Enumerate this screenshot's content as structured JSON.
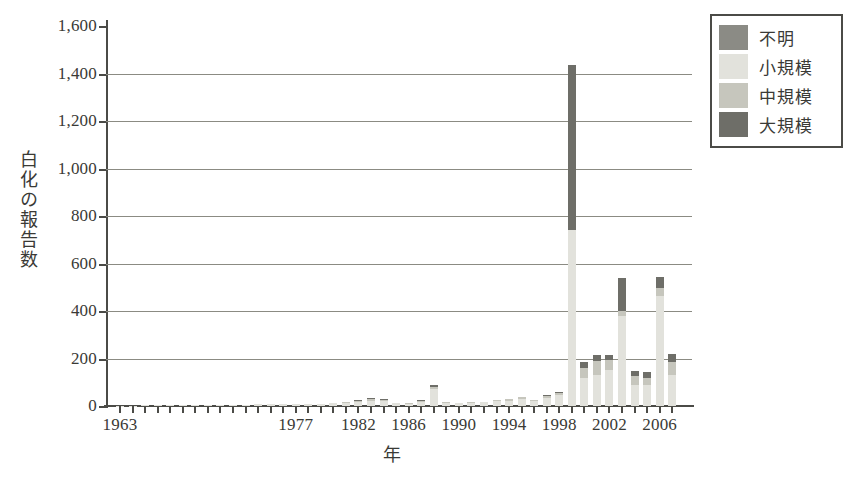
{
  "chart_data": {
    "type": "bar",
    "stacked": true,
    "title": "",
    "xlabel": "年",
    "ylabel": "白化の報告数",
    "ylim": [
      0,
      1600
    ],
    "ytick_labels": [
      "0",
      "200",
      "400",
      "600",
      "800",
      "1,000",
      "1,200",
      "1,400",
      "1,600"
    ],
    "ytick_values": [
      0,
      200,
      400,
      600,
      800,
      1000,
      1200,
      1400,
      1600
    ],
    "xtick_labels": [
      "1963",
      "1977",
      "1982",
      "1986",
      "1990",
      "1994",
      "1998",
      "2002",
      "2006"
    ],
    "xtick_values": [
      1963,
      1977,
      1982,
      1986,
      1990,
      1994,
      1998,
      2002,
      2006
    ],
    "grid": true,
    "legend_position": "outside-top-right",
    "series": [
      {
        "name": "不明",
        "color": "#8b8b85",
        "values": [
          0,
          0,
          0,
          0,
          0,
          0,
          0,
          0,
          0,
          0,
          0,
          0,
          0,
          0,
          0,
          0,
          0,
          0,
          0,
          0,
          0,
          0,
          0,
          0,
          0,
          0,
          0,
          0,
          0,
          0,
          0,
          0,
          0,
          0,
          0,
          0,
          0,
          0,
          0,
          0,
          0,
          0,
          0,
          0,
          0
        ]
      },
      {
        "name": "小規模",
        "color": "#e2e2dc",
        "values": [
          2,
          2,
          3,
          3,
          3,
          4,
          4,
          5,
          5,
          6,
          6,
          7,
          7,
          8,
          9,
          9,
          10,
          12,
          14,
          18,
          22,
          20,
          12,
          10,
          18,
          70,
          14,
          12,
          14,
          15,
          20,
          22,
          28,
          20,
          32,
          45,
          740,
          120,
          130,
          150,
          380,
          90,
          90,
          465,
          130
        ]
      },
      {
        "name": "中規模",
        "color": "#c6c6bd",
        "values": [
          0,
          0,
          0,
          0,
          0,
          0,
          0,
          0,
          0,
          0,
          0,
          0,
          0,
          0,
          0,
          0,
          0,
          0,
          2,
          4,
          8,
          6,
          2,
          2,
          4,
          12,
          3,
          2,
          3,
          4,
          5,
          6,
          8,
          5,
          10,
          8,
          0,
          40,
          60,
          45,
          18,
          35,
          30,
          30,
          55
        ]
      },
      {
        "name": "大規模",
        "color": "#6e6e68",
        "values": [
          0,
          0,
          0,
          0,
          0,
          0,
          0,
          0,
          0,
          0,
          0,
          0,
          0,
          0,
          0,
          0,
          0,
          0,
          0,
          3,
          4,
          3,
          0,
          0,
          2,
          6,
          0,
          0,
          0,
          0,
          2,
          3,
          4,
          2,
          5,
          4,
          695,
          25,
          25,
          20,
          140,
          22,
          22,
          50,
          35
        ]
      }
    ],
    "bars": [
      {
        "year": 1963,
        "small": 2,
        "medium": 0,
        "large": 0,
        "unknown": 0
      },
      {
        "year": 1964,
        "small": 2,
        "medium": 0,
        "large": 0,
        "unknown": 0
      },
      {
        "year": 1965,
        "small": 3,
        "medium": 0,
        "large": 0,
        "unknown": 0
      },
      {
        "year": 1966,
        "small": 3,
        "medium": 0,
        "large": 0,
        "unknown": 0
      },
      {
        "year": 1967,
        "small": 3,
        "medium": 0,
        "large": 0,
        "unknown": 0
      },
      {
        "year": 1968,
        "small": 4,
        "medium": 0,
        "large": 0,
        "unknown": 0
      },
      {
        "year": 1969,
        "small": 4,
        "medium": 0,
        "large": 0,
        "unknown": 0
      },
      {
        "year": 1970,
        "small": 5,
        "medium": 0,
        "large": 0,
        "unknown": 0
      },
      {
        "year": 1971,
        "small": 5,
        "medium": 0,
        "large": 0,
        "unknown": 0
      },
      {
        "year": 1972,
        "small": 6,
        "medium": 0,
        "large": 0,
        "unknown": 0
      },
      {
        "year": 1973,
        "small": 6,
        "medium": 0,
        "large": 0,
        "unknown": 0
      },
      {
        "year": 1974,
        "small": 7,
        "medium": 0,
        "large": 0,
        "unknown": 0
      },
      {
        "year": 1975,
        "small": 7,
        "medium": 0,
        "large": 0,
        "unknown": 0
      },
      {
        "year": 1976,
        "small": 8,
        "medium": 0,
        "large": 0,
        "unknown": 0
      },
      {
        "year": 1977,
        "small": 9,
        "medium": 0,
        "large": 0,
        "unknown": 0
      },
      {
        "year": 1978,
        "small": 9,
        "medium": 0,
        "large": 0,
        "unknown": 0
      },
      {
        "year": 1979,
        "small": 10,
        "medium": 0,
        "large": 0,
        "unknown": 0
      },
      {
        "year": 1980,
        "small": 12,
        "medium": 0,
        "large": 0,
        "unknown": 0
      },
      {
        "year": 1981,
        "small": 14,
        "medium": 2,
        "large": 0,
        "unknown": 0
      },
      {
        "year": 1982,
        "small": 18,
        "medium": 4,
        "large": 3,
        "unknown": 0
      },
      {
        "year": 1983,
        "small": 22,
        "medium": 8,
        "large": 4,
        "unknown": 0
      },
      {
        "year": 1984,
        "small": 20,
        "medium": 6,
        "large": 3,
        "unknown": 0
      },
      {
        "year": 1985,
        "small": 12,
        "medium": 2,
        "large": 0,
        "unknown": 0
      },
      {
        "year": 1986,
        "small": 10,
        "medium": 2,
        "large": 0,
        "unknown": 0
      },
      {
        "year": 1987,
        "small": 18,
        "medium": 4,
        "large": 2,
        "unknown": 0
      },
      {
        "year": 1988,
        "small": 70,
        "medium": 12,
        "large": 6,
        "unknown": 0
      },
      {
        "year": 1989,
        "small": 14,
        "medium": 3,
        "large": 0,
        "unknown": 0
      },
      {
        "year": 1990,
        "small": 12,
        "medium": 2,
        "large": 0,
        "unknown": 0
      },
      {
        "year": 1991,
        "small": 14,
        "medium": 3,
        "large": 0,
        "unknown": 0
      },
      {
        "year": 1992,
        "small": 15,
        "medium": 4,
        "large": 0,
        "unknown": 0
      },
      {
        "year": 1993,
        "small": 20,
        "medium": 5,
        "large": 2,
        "unknown": 0
      },
      {
        "year": 1994,
        "small": 22,
        "medium": 6,
        "large": 3,
        "unknown": 0
      },
      {
        "year": 1995,
        "small": 28,
        "medium": 8,
        "large": 4,
        "unknown": 0
      },
      {
        "year": 1996,
        "small": 20,
        "medium": 5,
        "large": 2,
        "unknown": 0
      },
      {
        "year": 1997,
        "small": 32,
        "medium": 10,
        "large": 5,
        "unknown": 0
      },
      {
        "year": 1998,
        "small": 45,
        "medium": 8,
        "large": 4,
        "unknown": 0
      },
      {
        "year": 1999,
        "small": 740,
        "medium": 0,
        "large": 695,
        "unknown": 0
      },
      {
        "year": 2000,
        "small": 120,
        "medium": 40,
        "large": 25,
        "unknown": 0
      },
      {
        "year": 2001,
        "small": 130,
        "medium": 60,
        "large": 25,
        "unknown": 0
      },
      {
        "year": 2002,
        "small": 150,
        "medium": 45,
        "large": 20,
        "unknown": 0
      },
      {
        "year": 2003,
        "small": 380,
        "medium": 18,
        "large": 140,
        "unknown": 0
      },
      {
        "year": 2004,
        "small": 90,
        "medium": 35,
        "large": 22,
        "unknown": 0
      },
      {
        "year": 2005,
        "small": 90,
        "medium": 30,
        "large": 22,
        "unknown": 0
      },
      {
        "year": 2006,
        "small": 465,
        "medium": 30,
        "large": 50,
        "unknown": 0
      },
      {
        "year": 2007,
        "small": 130,
        "medium": 55,
        "large": 35,
        "unknown": 0
      }
    ],
    "legend": [
      {
        "label": "不明",
        "color": "#8b8b85"
      },
      {
        "label": "小規模",
        "color": "#e2e2dc"
      },
      {
        "label": "中規模",
        "color": "#c6c6bd"
      },
      {
        "label": "大規模",
        "color": "#6e6e68"
      }
    ],
    "annotations": []
  },
  "colors": {
    "axis": "#4b4b47",
    "grid": "#8b8b83",
    "background": "#ffffff",
    "text": "#3a3a36"
  }
}
